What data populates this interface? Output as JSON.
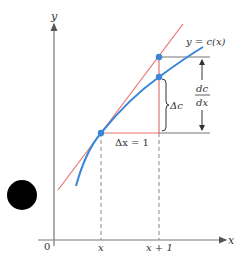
{
  "diagram": {
    "axes": {
      "y_label": "y",
      "x_label": "x",
      "origin_label": "0",
      "x_ticks": [
        "x",
        "x + 1"
      ]
    },
    "curve_label": "y = c(x)",
    "delta_x_label": "Δx = 1",
    "delta_c_label": "Δc",
    "derivative_label": {
      "numerator": "dc",
      "denominator": "dx"
    },
    "colors": {
      "curve": "#3a86d8",
      "tangent": "#e8736f",
      "axes": "#777777",
      "points": "#3a86d8",
      "guides": "#777777"
    }
  }
}
